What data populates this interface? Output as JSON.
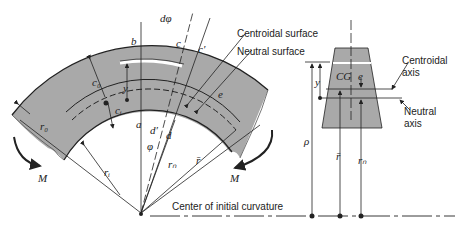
{
  "figure": {
    "labels": {
      "centroidal_surface": "Centroidal surface",
      "neutral_surface": "Neutral surface",
      "centroidal_axis_l1": "Centroidal",
      "centroidal_axis_l2": "axis",
      "neutral_axis_l1": "Neutral",
      "neutral_axis_l2": "axis",
      "center": "Center of initial curvature"
    },
    "symbols": {
      "dphi": "dφ",
      "b": "b",
      "c": "c",
      "c_prime": "c′",
      "c_o": "c₀",
      "c_i": "cᵢ",
      "y": "y",
      "e": "e",
      "r_o": "r₀",
      "r_i": "rᵢ",
      "r_n": "rₙ",
      "r_bar": "r̄",
      "a": "a",
      "d": "d",
      "d_prime": "d′",
      "phi": "φ",
      "M": "M",
      "rho": "ρ",
      "CG": "CG"
    }
  },
  "colors": {
    "section_fill": "#a9a9a9",
    "line": "#222222",
    "background": "#ffffff"
  }
}
